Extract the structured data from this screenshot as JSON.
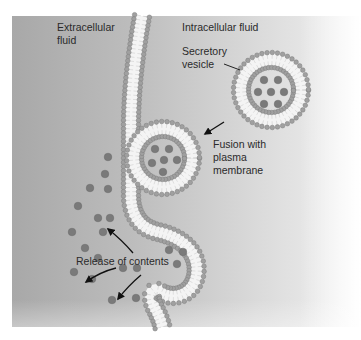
{
  "figure": {
    "regions": {
      "extracellular": [
        "Extracellular",
        "fluid"
      ],
      "intracellular": "Intracellular fluid"
    },
    "labels": {
      "secretory_vesicle": [
        "Secretory",
        "vesicle"
      ],
      "fusion": [
        "Fusion with",
        "plasma",
        "membrane"
      ],
      "release": "Release of contents"
    },
    "colors": {
      "background_left": "#a9a9a9",
      "background_right": "#e6e6e6",
      "lipid_head": "#a0a0a0",
      "lipid_head_stroke": "#7c7c7c",
      "lipid_tail": "#f4f4f4",
      "content_particle": "#7a7a7a",
      "text": "#2a2a2a"
    }
  }
}
